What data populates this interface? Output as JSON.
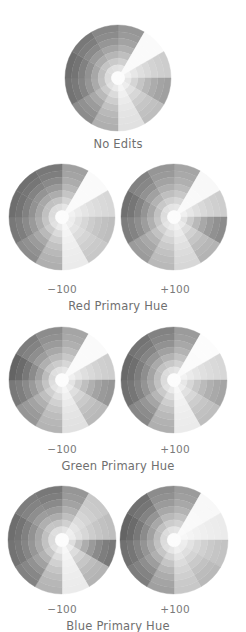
{
  "figure": {
    "rings": 8,
    "sectors": 12,
    "panels": [
      {
        "id": "no-edits",
        "caption": "No Edits",
        "wheels": [
          {
            "label": "",
            "cx": 118,
            "cy": 78,
            "r": 53,
            "sector_shades": [
              150,
              250,
              205,
              160,
              190,
              225,
              175,
              140,
              115,
              110,
              120,
              135
            ]
          }
        ]
      },
      {
        "id": "red-primary-hue",
        "caption": "Red Primary Hue",
        "wheels": [
          {
            "label": "-100",
            "cx": 62,
            "cy": 217,
            "r": 53,
            "sector_shades": [
              160,
              250,
              215,
              190,
              200,
              235,
              175,
              140,
              120,
              110,
              112,
              120
            ]
          },
          {
            "label": "+100",
            "cx": 174,
            "cy": 217,
            "r": 53,
            "sector_shades": [
              165,
              248,
              205,
              140,
              180,
              215,
              185,
              155,
              125,
              112,
              130,
              150
            ]
          }
        ]
      },
      {
        "id": "green-primary-hue",
        "caption": "Green Primary Hue",
        "wheels": [
          {
            "label": "-100",
            "cx": 62,
            "cy": 380,
            "r": 53,
            "sector_shades": [
              165,
              250,
              205,
              150,
              185,
              225,
              180,
              150,
              120,
              100,
              125,
              140
            ]
          },
          {
            "label": "+100",
            "cx": 174,
            "cy": 380,
            "r": 53,
            "sector_shades": [
              155,
              252,
              215,
              165,
              190,
              235,
              175,
              135,
              112,
              105,
              115,
              130
            ]
          }
        ]
      },
      {
        "id": "blue-primary-hue",
        "caption": "Blue Primary Hue",
        "wheels": [
          {
            "label": "-100",
            "cx": 62,
            "cy": 540,
            "r": 54,
            "sector_shades": [
              150,
              200,
              190,
              120,
              180,
              235,
              180,
              130,
              115,
              110,
              125,
              120
            ]
          },
          {
            "label": "+100",
            "cx": 174,
            "cy": 540,
            "r": 54,
            "sector_shades": [
              155,
              248,
              235,
              195,
              185,
              200,
              160,
              125,
              112,
              100,
              112,
              140
            ]
          }
        ]
      }
    ]
  },
  "labels": {
    "no_edits": "No Edits",
    "red_minus": "−100",
    "red_plus": "+100",
    "red_caption": "Red Primary Hue",
    "green_minus": "−100",
    "green_plus": "+100",
    "green_caption": "Green Primary Hue",
    "blue_minus": "−100",
    "blue_plus": "+100",
    "blue_caption": "Blue Primary Hue"
  }
}
